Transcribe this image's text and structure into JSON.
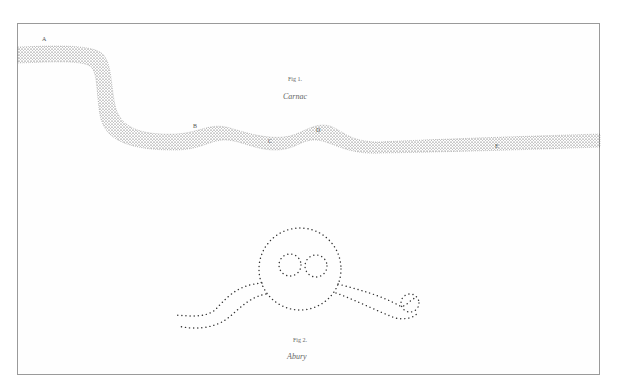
{
  "plate": {
    "fig1": {
      "caption": "Fig 1.",
      "title": "Carnac",
      "points": [
        "A",
        "B",
        "C",
        "D",
        "E"
      ]
    },
    "fig2": {
      "caption": "Fig 2.",
      "title": "Abury"
    }
  },
  "colors": {
    "ink": "#333333",
    "frame": "#9a9a9a",
    "paper": "#fefefe"
  }
}
